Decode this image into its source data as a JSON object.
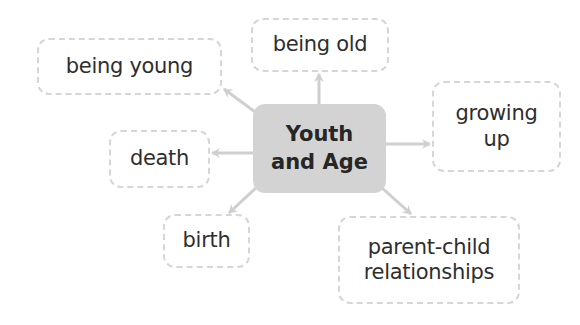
{
  "diagram": {
    "type": "concept-web",
    "center": {
      "line1": "Youth",
      "line2": "and Age"
    },
    "nodes": [
      {
        "id": "being-young",
        "line1": "being young",
        "line2": ""
      },
      {
        "id": "being-old",
        "line1": "being old",
        "line2": ""
      },
      {
        "id": "growing-up",
        "line1": "growing",
        "line2": "up"
      },
      {
        "id": "death",
        "line1": "death",
        "line2": ""
      },
      {
        "id": "birth",
        "line1": "birth",
        "line2": ""
      },
      {
        "id": "parent-child-relationships",
        "line1": "parent-child",
        "line2": "relationships"
      }
    ],
    "edges": [
      {
        "from": "Youth and Age",
        "to": "being young"
      },
      {
        "from": "Youth and Age",
        "to": "being old"
      },
      {
        "from": "Youth and Age",
        "to": "growing up"
      },
      {
        "from": "Youth and Age",
        "to": "death"
      },
      {
        "from": "Youth and Age",
        "to": "birth"
      },
      {
        "from": "Youth and Age",
        "to": "parent-child relationships"
      }
    ],
    "colors": {
      "center_fill": "#d3d3d3",
      "node_border": "#d6d6d6",
      "arrow": "#cfcfcf",
      "text": "#2e2e2e"
    }
  }
}
